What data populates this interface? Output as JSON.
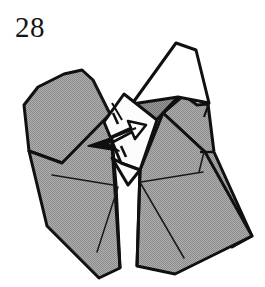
{
  "figure": {
    "kind": "origami-instruction-diagram",
    "step_number": "28",
    "caption": "",
    "background_color": "#ffffff",
    "ink_color": "#101010",
    "paper_front_color": "#a3a3a3",
    "paper_back_color": "#ffffff",
    "crease_color": "#1a1a1a",
    "shade_dark_color": "#8c8c8c",
    "shade_light_color": "#b5b5b5"
  },
  "panels": [
    {
      "id": "left-wing-upper",
      "name": "left-upper-flap",
      "fill": "#a3a3a3",
      "points": "22,104 36,86 63,74 89,71 107,96 110,114 86,143 63,162 28,150"
    },
    {
      "id": "left-wing-lower",
      "name": "left-lower-panel",
      "fill": "#a3a3a3",
      "points": "28,150 63,162 110,114 132,166 136,212 120,268 98,277 46,227"
    },
    {
      "id": "center-left-body",
      "name": "center-left-body-panel",
      "fill": "#a3a3a3",
      "points": "63,162 110,114 132,166 136,212 120,268 98,277"
    },
    {
      "id": "center-right-body",
      "name": "center-right-body-panel",
      "fill": "#a3a3a3",
      "points": "139,168 160,112 205,150 232,202 250,236 172,272 138,268"
    },
    {
      "id": "right-wing",
      "name": "right-outer-flap",
      "fill": "#a3a3a3",
      "points": "160,112 183,96 196,104 205,150 232,202 250,236 205,150"
    },
    {
      "id": "right-upper-gray",
      "name": "right-upper-shaded-flap",
      "fill": "#8c8c8c",
      "points": "133,104 156,84 176,96 161,112 146,128"
    },
    {
      "id": "top-white-flap",
      "name": "top-right-white-flap",
      "fill": "#ffffff",
      "points": "132,104 176,43 195,49 208,103 176,96"
    },
    {
      "id": "center-white-flap",
      "name": "center-white-arrow-flap",
      "fill": "#fbfbfb",
      "points": "106,121 124,95 155,120 139,168 120,160"
    }
  ],
  "creases": [
    {
      "name": "left-wing-fold",
      "d": "M 22,104 L 110,114"
    },
    {
      "name": "center-left-spine",
      "d": "M 110,114 L 120,268"
    },
    {
      "name": "left-valley-crease",
      "d": "M 52,173 L 122,183"
    },
    {
      "name": "left-diagonal-crease",
      "d": "M 122,183 L 97,257"
    },
    {
      "name": "right-valley-crease",
      "d": "M 138,178 L 205,172"
    },
    {
      "name": "right-diagonal-crease",
      "d": "M 138,178 L 186,262"
    },
    {
      "name": "right-outer-crease",
      "d": "M 205,150 L 200,168"
    },
    {
      "name": "top-flap-crease",
      "d": "M 176,96 L 161,112"
    }
  ],
  "arrows": [
    {
      "name": "push-in-arrow",
      "style": "hollow-outline-arrow",
      "direction": "up-right",
      "tail": "dashed"
    },
    {
      "name": "fold-direction-arrow",
      "style": "thin-line-arrow",
      "direction": "left"
    }
  ]
}
